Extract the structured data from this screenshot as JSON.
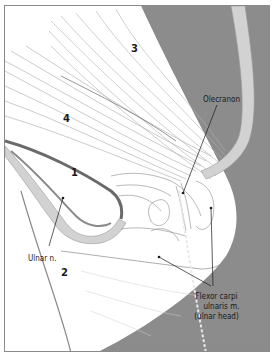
{
  "figure": {
    "colors": {
      "background_gray": "#8c8c8c",
      "tissue_white": "#ffffff",
      "line": "#6e6e6e",
      "retractor": "#d2d2d2",
      "text": "#1a1a1a",
      "frame": "#8a8a8a"
    },
    "numerals": [
      {
        "id": "n3",
        "text": "3"
      },
      {
        "id": "n4",
        "text": "4"
      },
      {
        "id": "n1",
        "text": "1"
      },
      {
        "id": "n2",
        "text": "2"
      }
    ],
    "labels": {
      "olecranon": "Olecranon",
      "ulnar_nerve": "Ulnar n.",
      "fcu_line1": "Flexor carpi",
      "fcu_line2": "ulnaris m.",
      "fcu_line3": "(ulnar head)"
    }
  }
}
